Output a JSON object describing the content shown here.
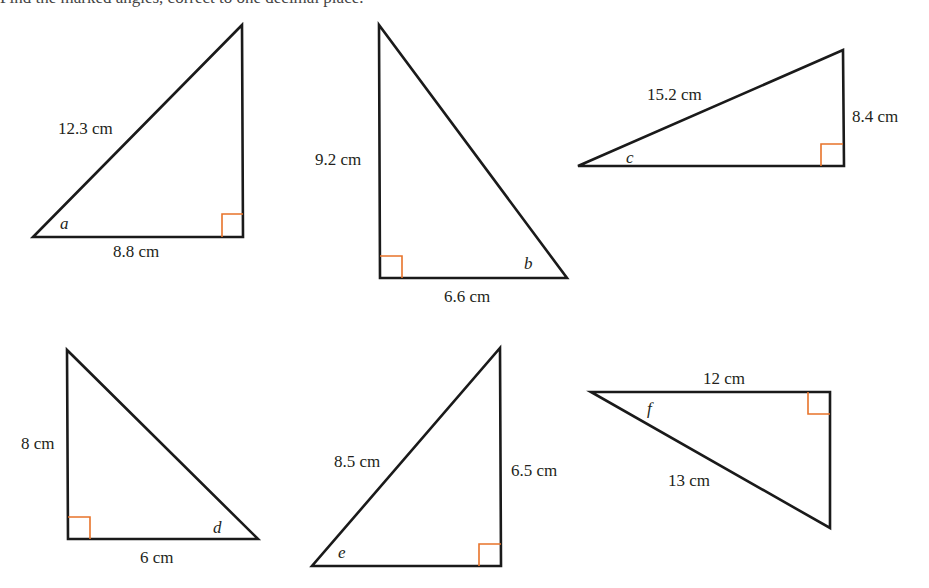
{
  "instruction": "Find the marked angles, correct to one decimal place.",
  "colors": {
    "lines": "#1a1a1a",
    "right_angle_marker": "#e8732a",
    "text": "#231f20"
  },
  "triangles": [
    {
      "id": "a",
      "angle_label": "a",
      "sides": {
        "hypotenuse": "12.3 cm",
        "adjacent": "8.8 cm"
      }
    },
    {
      "id": "b",
      "angle_label": "b",
      "sides": {
        "opposite": "9.2 cm",
        "adjacent": "6.6 cm"
      }
    },
    {
      "id": "c",
      "angle_label": "c",
      "sides": {
        "hypotenuse": "15.2 cm",
        "opposite": "8.4 cm"
      }
    },
    {
      "id": "d",
      "angle_label": "d",
      "sides": {
        "opposite": "8 cm",
        "adjacent": "6 cm"
      }
    },
    {
      "id": "e",
      "angle_label": "e",
      "sides": {
        "hypotenuse": "8.5 cm",
        "opposite": "6.5 cm"
      }
    },
    {
      "id": "f",
      "angle_label": "f",
      "sides": {
        "adjacent": "12 cm",
        "hypotenuse": "13 cm"
      }
    }
  ]
}
